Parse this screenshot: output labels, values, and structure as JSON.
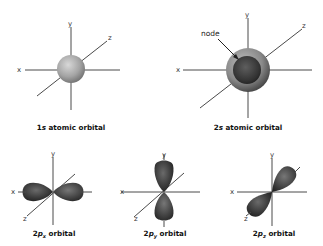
{
  "diagrams": {
    "s1": {
      "caption_num": "1",
      "caption_sub": "s",
      "caption_rest": " atomic orbital",
      "axes": {
        "x": "x",
        "y": "y",
        "z": "z"
      }
    },
    "s2": {
      "caption_num": "2",
      "caption_sub": "s",
      "caption_rest": " atomic orbital",
      "node_label": "node",
      "axes": {
        "x": "x",
        "y": "y",
        "z": "z"
      }
    },
    "px": {
      "caption_num": "2",
      "caption_p": "p",
      "caption_sub": "x",
      "caption_rest": " orbital",
      "axes": {
        "x": "x",
        "y": "y",
        "z": "z"
      }
    },
    "py": {
      "caption_num": "2",
      "caption_p": "p",
      "caption_sub": "y",
      "caption_rest": " orbital",
      "axes": {
        "x": "x",
        "y": "y",
        "z": "z"
      }
    },
    "pz": {
      "caption_num": "2",
      "caption_p": "p",
      "caption_sub": "z",
      "caption_rest": " orbital",
      "axes": {
        "x": "x",
        "y": "y",
        "z": "z"
      }
    }
  },
  "colors": {
    "s1_sphere": "#a8a8a8",
    "s2_outer": "#8a8a8a",
    "s2_inner": "#3a3a3a",
    "lobe_dark": "#2e2e2e",
    "lobe_light": "#5a5a5a",
    "axis": "#4a4a4a"
  }
}
